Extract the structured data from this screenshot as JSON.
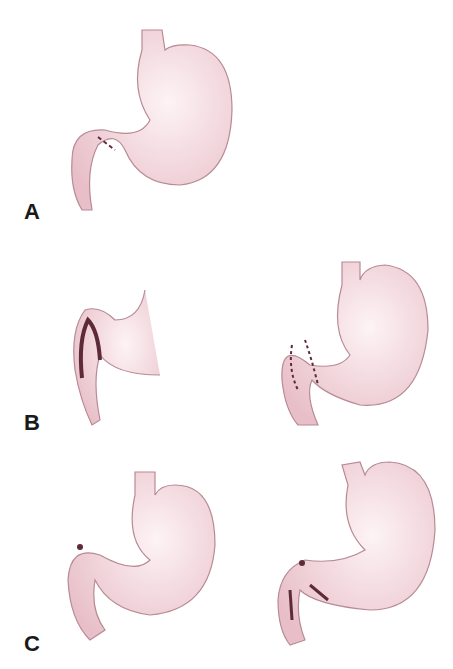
{
  "figure": {
    "panels": [
      {
        "label": "A",
        "drawings": [
          "stomach-with-dashed-incision-at-pylorus"
        ]
      },
      {
        "label": "B",
        "drawings": [
          "pylorus-detail-with-dark-incision",
          "stomach-with-dashed-pyloric-outline"
        ]
      },
      {
        "label": "C",
        "drawings": [
          "stomach-with-closed-pylorus-mark",
          "stomach-with-pyloric-incision-marks"
        ]
      }
    ],
    "colors": {
      "fill": "#f3d7dc",
      "fill_light": "#fbeef0",
      "outline": "#b88a94",
      "mark": "#5e2a38",
      "label": "#1a1a1a"
    }
  }
}
